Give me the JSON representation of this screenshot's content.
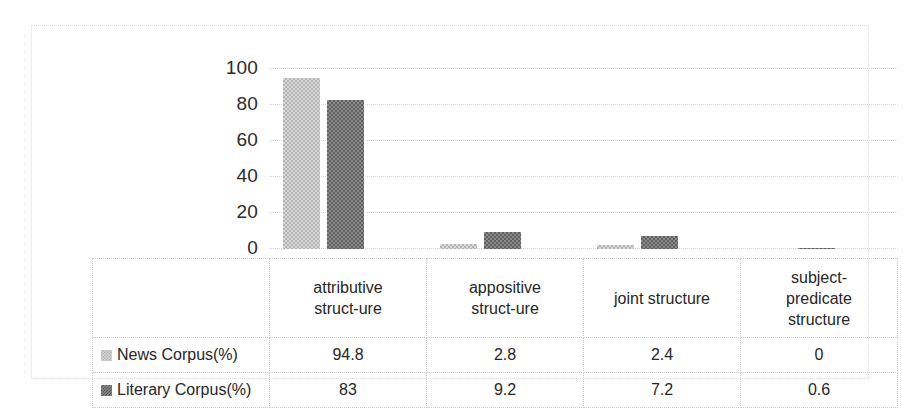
{
  "chart_data": {
    "type": "bar",
    "title": "",
    "subtitle": "",
    "xlabel": "",
    "ylabel": "",
    "ylim": [
      0,
      100
    ],
    "yticks": [
      100,
      80,
      60,
      40,
      20,
      0
    ],
    "grid": true,
    "legend_position": "data-table-left",
    "categories": [
      "attributive struct-ure",
      "appositive struct-ure",
      "joint structure",
      "subject-predicate structure"
    ],
    "category_lines": [
      [
        "attributive",
        "struct-ure"
      ],
      [
        "appositive",
        "struct-ure"
      ],
      [
        "joint structure"
      ],
      [
        "subject-",
        "predicate",
        "structure"
      ]
    ],
    "series": [
      {
        "name": "News Corpus(%)",
        "color": "#d9d9d9",
        "values": [
          94.8,
          2.8,
          2.4,
          0
        ],
        "value_labels": [
          "94.8",
          "2.8",
          "2.4",
          "0"
        ]
      },
      {
        "name": "Literary Corpus(%)",
        "color": "#808080",
        "values": [
          83,
          9.2,
          7.2,
          0.6
        ],
        "value_labels": [
          "83",
          "9.2",
          "7.2",
          "0.6"
        ]
      }
    ]
  },
  "table": {
    "legend_header": "",
    "row_labels": [
      "News Corpus(%)",
      "Literary Corpus(%)"
    ]
  },
  "colors": {
    "series_light": "#d9d9d9",
    "series_dark": "#808080",
    "gridline": "#d2d2d2",
    "border": "#c9c9c9",
    "text": "#262626",
    "background": "#ffffff"
  }
}
